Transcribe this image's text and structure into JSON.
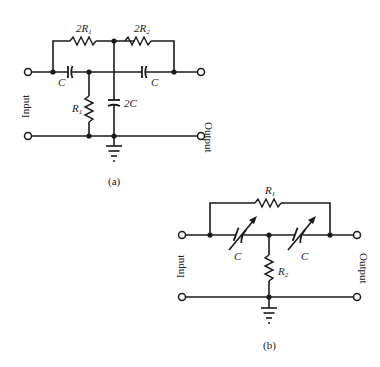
{
  "diagram_a": {
    "caption": "(a)",
    "input_label": "Input",
    "output_label": "Output",
    "components": {
      "top_left_resistor": {
        "prefix": "2",
        "name": "R",
        "sub": "1"
      },
      "top_right_resistor": {
        "prefix": "2",
        "name": "R",
        "sub": "2"
      },
      "left_capacitor": {
        "name": "C"
      },
      "right_capacitor": {
        "name": "C"
      },
      "shunt_resistor": {
        "name": "R",
        "sub": "1"
      },
      "shunt_capacitor": {
        "name": "2C"
      }
    }
  },
  "diagram_b": {
    "caption": "(b)",
    "input_label": "Input",
    "output_label": "Output",
    "components": {
      "bridge_resistor": {
        "name": "R",
        "sub": "1"
      },
      "left_variable_capacitor": {
        "name": "C"
      },
      "right_variable_capacitor": {
        "name": "C"
      },
      "shunt_resistor": {
        "name": "R",
        "sub": "2"
      }
    }
  }
}
